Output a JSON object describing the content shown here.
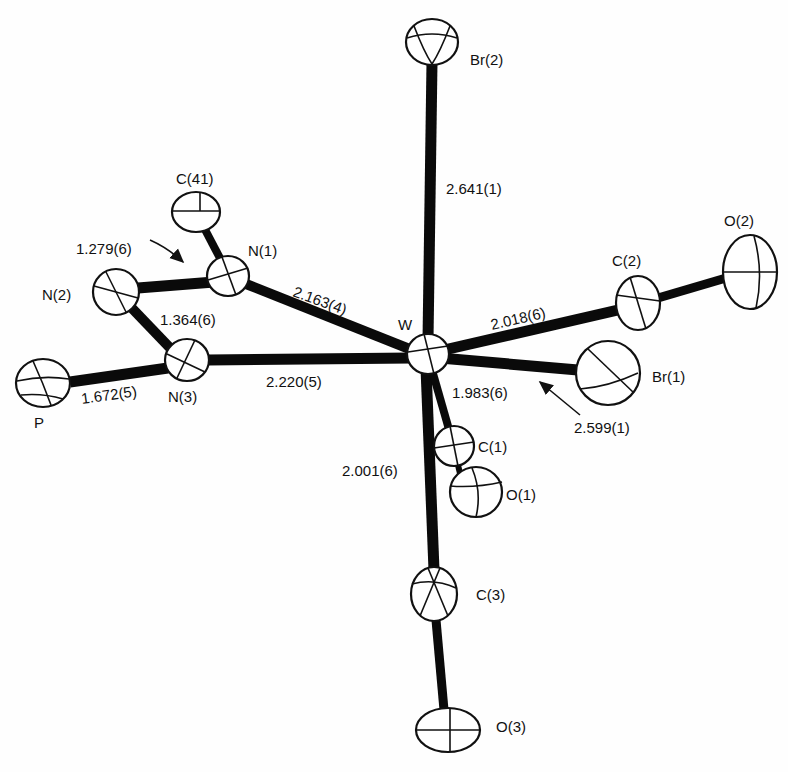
{
  "diagram": {
    "type": "ORTEP molecular structure",
    "central_atom": "W",
    "atoms": [
      {
        "id": "Br2",
        "label": "Br(2)",
        "x": 432,
        "y": 42,
        "rx": 26,
        "ry": 23
      },
      {
        "id": "C41",
        "label": "C(41)",
        "x": 196,
        "y": 212,
        "rx": 24,
        "ry": 20
      },
      {
        "id": "N1",
        "label": "N(1)",
        "x": 228,
        "y": 276,
        "rx": 21,
        "ry": 20
      },
      {
        "id": "N2",
        "label": "N(2)",
        "x": 116,
        "y": 292,
        "rx": 23,
        "ry": 23
      },
      {
        "id": "N3",
        "label": "N(3)",
        "x": 187,
        "y": 360,
        "rx": 22,
        "ry": 21
      },
      {
        "id": "P",
        "label": "P",
        "x": 43,
        "y": 383,
        "rx": 27,
        "ry": 24
      },
      {
        "id": "W",
        "label": "W",
        "x": 428,
        "y": 354,
        "rx": 21,
        "ry": 20
      },
      {
        "id": "C2",
        "label": "C(2)",
        "x": 638,
        "y": 303,
        "rx": 22,
        "ry": 27
      },
      {
        "id": "O2",
        "label": "O(2)",
        "x": 750,
        "y": 272,
        "rx": 27,
        "ry": 37
      },
      {
        "id": "Br1",
        "label": "Br(1)",
        "x": 608,
        "y": 373,
        "rx": 32,
        "ry": 32
      },
      {
        "id": "C1",
        "label": "C(1)",
        "x": 454,
        "y": 446,
        "rx": 20,
        "ry": 20
      },
      {
        "id": "O1",
        "label": "O(1)",
        "x": 476,
        "y": 492,
        "rx": 26,
        "ry": 25
      },
      {
        "id": "C3",
        "label": "C(3)",
        "x": 434,
        "y": 594,
        "rx": 23,
        "ry": 27
      },
      {
        "id": "O3",
        "label": "O(3)",
        "x": 448,
        "y": 730,
        "rx": 32,
        "ry": 22
      }
    ],
    "bonds": [
      {
        "from": "W",
        "to": "Br2",
        "length": "2.641(1)"
      },
      {
        "from": "W",
        "to": "N1",
        "length": "2.163(4)"
      },
      {
        "from": "W",
        "to": "N3",
        "length": "2.220(5)"
      },
      {
        "from": "W",
        "to": "C2",
        "length": "2.018(6)"
      },
      {
        "from": "W",
        "to": "Br1",
        "length": "2.599(1)"
      },
      {
        "from": "W",
        "to": "C1",
        "length": "1.983(6)"
      },
      {
        "from": "W",
        "to": "C3",
        "length": "2.001(6)"
      },
      {
        "from": "N1",
        "to": "N2",
        "length": "1.279(6)"
      },
      {
        "from": "N2",
        "to": "N3",
        "length": "1.364(6)"
      },
      {
        "from": "N3",
        "to": "P",
        "length": "1.672(5)"
      },
      {
        "from": "N1",
        "to": "C41",
        "length": ""
      },
      {
        "from": "C2",
        "to": "O2",
        "length": ""
      },
      {
        "from": "C1",
        "to": "O1",
        "length": ""
      },
      {
        "from": "C3",
        "to": "O3",
        "length": ""
      }
    ]
  },
  "labels": {
    "br2": "Br(2)",
    "c41": "C(41)",
    "n1": "N(1)",
    "n2": "N(2)",
    "n3": "N(3)",
    "p": "P",
    "w": "W",
    "c2": "C(2)",
    "o2": "O(2)",
    "br1": "Br(1)",
    "c1": "C(1)",
    "o1": "O(1)",
    "c3": "C(3)",
    "o3": "O(3)"
  },
  "bond_lengths": {
    "w_br2": "2.641(1)",
    "w_n1": "2.163(4)",
    "w_n3": "2.220(5)",
    "w_c2": "2.018(6)",
    "w_br1": "2.599(1)",
    "w_c1": "1.983(6)",
    "w_c3": "2.001(6)",
    "n1_n2": "1.279(6)",
    "n2_n3": "1.364(6)",
    "n3_p": "1.672(5)"
  }
}
